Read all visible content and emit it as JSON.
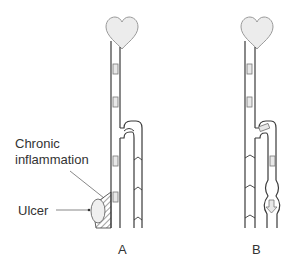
{
  "figure": {
    "panels": [
      {
        "id": "A",
        "label": "A"
      },
      {
        "id": "B",
        "label": "B"
      }
    ],
    "annotations": {
      "chronic_line1": "Chronic",
      "chronic_line2": "inflammation",
      "ulcer": "Ulcer"
    },
    "colors": {
      "stroke": "#3a3a3a",
      "heart_fill": "#ececec",
      "heart_stroke": "#9a9a9a",
      "arrow_fill": "#e8e8e8",
      "ulcer_fill": "#efefef",
      "text": "#333333"
    }
  }
}
